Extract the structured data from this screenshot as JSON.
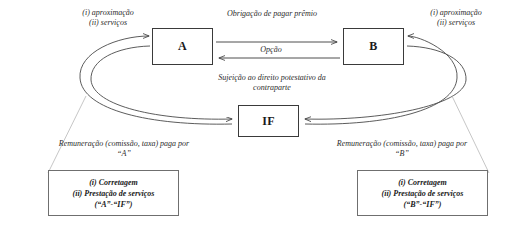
{
  "diagram": {
    "nodes": [
      {
        "id": "a",
        "label": "A"
      },
      {
        "id": "b",
        "label": "B"
      },
      {
        "id": "if",
        "label": "IF"
      }
    ],
    "edge_labels": {
      "left_services_line1": "(i) aproximação",
      "left_services_line2": "(ii) serviços",
      "right_services_line1": "(i) aproximação",
      "right_services_line2": "(ii) serviços",
      "premio": "Obrigação de pagar prêmio",
      "opcao": "Opção",
      "sujeicao_line1": "Sujeição ao direito potestativo da",
      "sujeicao_line2": "contraparte",
      "remuneracao_left_line1": "Remuneração (comissão, taxa) paga por",
      "remuneracao_left_line2": "“A”",
      "remuneracao_right_line1": "Remuneração (comissão, taxa) paga por",
      "remuneracao_right_line2": "“B”"
    },
    "callouts": {
      "left": {
        "line1": "(i) Corretagem",
        "line2": "(ii) Prestação de serviços",
        "line3": "(“A”-“IF”)"
      },
      "right": {
        "line1": "(i) Corretagem",
        "line2": "(ii) Prestação de serviços",
        "line3": "(“B”-“IF”)"
      }
    },
    "colors": {
      "stroke": "#3a3a3a",
      "curve": "#4a4a4a",
      "leader": "#b8b8b8",
      "box_border": "#6f6f6f",
      "text": "#1a1a1a",
      "background": "#ffffff"
    }
  }
}
